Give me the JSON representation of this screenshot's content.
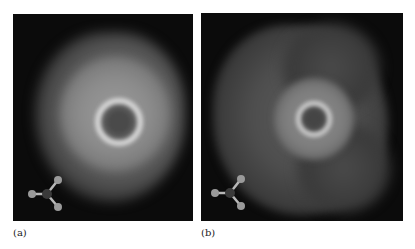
{
  "figure": {
    "panels": [
      {
        "id": "a",
        "label": "(a)",
        "description": "Density map with bright inner ring and broad rounded outer lobe",
        "inset": "trigonal-molecule-ball-and-stick"
      },
      {
        "id": "b",
        "label": "(b)",
        "description": "Density map with smaller bright inner ring and three-lobed outer envelope",
        "inset": "trigonal-molecule-ball-and-stick"
      }
    ],
    "colors": {
      "background": "#0b0b0b",
      "ring_highlight": "#d8d8d8",
      "atom": "#9a9a9a",
      "center_atom": "#3a3a3a"
    }
  }
}
